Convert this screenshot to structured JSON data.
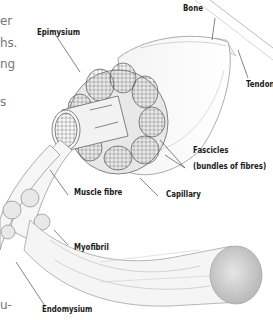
{
  "body_text_fragments": [
    "er",
    "hs.",
    "ng",
    "s",
    "u-"
  ],
  "labels": {
    "bone": "Bone",
    "epimysium": "Epimysium",
    "tendon": "Tendon",
    "fascicles": "Fascicles",
    "fascicles_note": "(bundles of fibres)",
    "capillary": "Capillary",
    "muscle_fibre": "Muscle fibre",
    "myofibril": "Myofibril",
    "endomysium": "Endomysium"
  }
}
